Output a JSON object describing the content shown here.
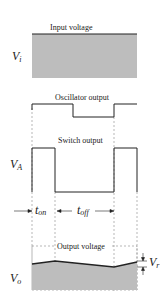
{
  "diagram": {
    "type": "switching-regulator-waveforms",
    "colors": {
      "line": "#222222",
      "fill": "#bdbdbd",
      "dash": "#888888"
    },
    "input": {
      "title": "Input voltage",
      "symbol": "V",
      "subscript": "i"
    },
    "oscillator": {
      "title": "Oscillator output"
    },
    "switch": {
      "title": "Switch output",
      "symbol": "V",
      "subscript": "A"
    },
    "timing": {
      "ton_symbol": "t",
      "ton_sub": "on",
      "toff_symbol": "t",
      "toff_sub": "off"
    },
    "output": {
      "title": "Output voltage",
      "symbol": "V",
      "subscript": "o",
      "ripple_symbol": "V",
      "ripple_sub": "r"
    }
  }
}
